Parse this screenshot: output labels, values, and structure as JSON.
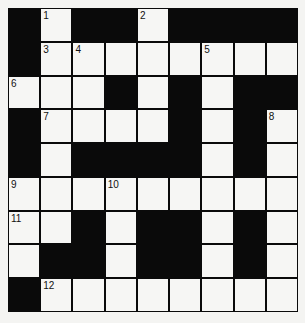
{
  "puzzle": {
    "cols": 9,
    "rows": 9,
    "grid": [
      "B.BB.BBBB",
      "B........",
      "...B.B.BB",
      "B....B.B.",
      "B.BBBB.B.",
      ".........",
      "..B.BB.B.",
      ".BB.BB.B.",
      "B........"
    ],
    "numbers": [
      {
        "row": 0,
        "col": 1,
        "n": "1"
      },
      {
        "row": 0,
        "col": 4,
        "n": "2"
      },
      {
        "row": 1,
        "col": 1,
        "n": "3"
      },
      {
        "row": 1,
        "col": 2,
        "n": "4"
      },
      {
        "row": 1,
        "col": 6,
        "n": "5"
      },
      {
        "row": 2,
        "col": 0,
        "n": "6"
      },
      {
        "row": 3,
        "col": 1,
        "n": "7"
      },
      {
        "row": 3,
        "col": 8,
        "n": "8"
      },
      {
        "row": 5,
        "col": 0,
        "n": "9"
      },
      {
        "row": 5,
        "col": 3,
        "n": "10"
      },
      {
        "row": 6,
        "col": 0,
        "n": "11"
      },
      {
        "row": 8,
        "col": 1,
        "n": "12"
      }
    ]
  }
}
